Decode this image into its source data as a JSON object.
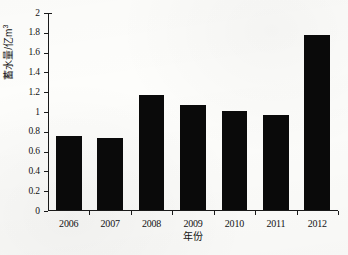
{
  "chart_data": {
    "type": "bar",
    "title": "",
    "subtitle": "",
    "categories": [
      "2006",
      "2007",
      "2008",
      "2009",
      "2010",
      "2011",
      "2012"
    ],
    "values": [
      0.75,
      0.73,
      1.16,
      1.06,
      1.0,
      0.96,
      1.77
    ],
    "series": [
      {
        "name": "蓄水量",
        "values": [
          0.75,
          0.73,
          1.16,
          1.06,
          1.0,
          0.96,
          1.77
        ]
      }
    ],
    "xlabel": "年份",
    "ylabel": "蓄水量/亿m",
    "ylabel_superscript": "3",
    "ylabel_full": "蓄水量/亿m³",
    "ylim": [
      0,
      2
    ],
    "ytick_step": 0.2,
    "yticks": [
      "0",
      "0.2",
      "0.4",
      "0.6",
      "0.8",
      "1",
      "1.2",
      "1.4",
      "1.6",
      "1.8",
      "2"
    ],
    "ytick_values": [
      0,
      0.2,
      0.4,
      0.6,
      0.8,
      1,
      1.2,
      1.4,
      1.6,
      1.8,
      2
    ],
    "grid": false,
    "legend": "none",
    "bar_color": "#0a0a0a",
    "axis_color": "#1a1a1a",
    "background_color": "#fdfdfb"
  }
}
